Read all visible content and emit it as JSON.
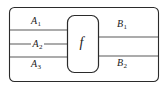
{
  "diagram": {
    "type": "string-diagram",
    "outer_box": {
      "name": "outer-frame",
      "x": 9,
      "y": 7,
      "width": 149,
      "height": 74,
      "corner_radius": 5,
      "stroke": "#2b2b2b",
      "fill": "#ffffff"
    },
    "inner_box": {
      "name": "morphism-box",
      "label": "f",
      "x": 67,
      "y": 15,
      "width": 31,
      "height": 57,
      "corner_radius": 7,
      "stroke": "#2b2b2b",
      "fill": "#ffffff"
    },
    "wire_color": "#8f8f8f",
    "wire_width": 1.6,
    "inputs": [
      {
        "name": "input-wire-a1",
        "label": "A",
        "subscript": "1",
        "y": 30,
        "x_start": 9,
        "x_end": 67,
        "label_x": 31,
        "label_y": 16,
        "label_on_wire": false
      },
      {
        "name": "input-wire-a2",
        "label": "A",
        "subscript": "2",
        "y": 44,
        "x_start": 9,
        "x_end": 67,
        "label_x": 31,
        "label_y": 39,
        "label_on_wire": true
      },
      {
        "name": "input-wire-a3",
        "label": "A",
        "subscript": "3",
        "y": 57,
        "x_start": 9,
        "x_end": 67,
        "label_x": 31,
        "label_y": 59,
        "label_on_wire": false
      }
    ],
    "outputs": [
      {
        "name": "output-wire-b1",
        "label": "B",
        "subscript": "1",
        "y": 37,
        "x_start": 98,
        "x_end": 158,
        "label_x": 117,
        "label_y": 19,
        "label_on_wire": false
      },
      {
        "name": "output-wire-b2",
        "label": "B",
        "subscript": "2",
        "y": 56,
        "x_start": 98,
        "x_end": 158,
        "label_x": 117,
        "label_y": 58,
        "label_on_wire": false
      }
    ]
  }
}
